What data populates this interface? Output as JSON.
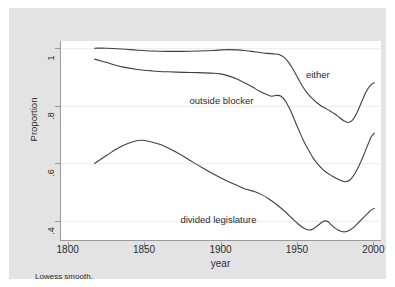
{
  "chart_data": {
    "type": "line",
    "title": "",
    "xlabel": "year",
    "ylabel": "Proportion",
    "note": "Lowess smooth.",
    "xlim": [
      1795,
      2005
    ],
    "ylim": [
      0.33,
      1.025
    ],
    "xticks": [
      "1800",
      "1850",
      "1900",
      "1950",
      "2000"
    ],
    "xtick_values": [
      1800,
      1850,
      1900,
      1950,
      2000
    ],
    "yticks": [
      "1",
      ".8",
      ".6",
      ".4"
    ],
    "ytick_values": [
      1,
      0.8,
      0.6,
      0.4
    ],
    "grid": "horizontal",
    "legend_position": "inline-annotations",
    "line_color": "#404040",
    "grid_color": "#eaeaea",
    "plot_background": "#ffffff",
    "graph_background": "#e3e3e3",
    "series": [
      {
        "name": "either",
        "label": "either",
        "label_x": 1963,
        "label_y": 0.905,
        "x": [
          1817,
          1825,
          1835,
          1845,
          1855,
          1865,
          1875,
          1885,
          1895,
          1900,
          1905,
          1910,
          1915,
          1920,
          1925,
          1930,
          1935,
          1938,
          1941,
          1944,
          1947,
          1950,
          1953,
          1956,
          1959,
          1962,
          1965,
          1968,
          1971,
          1974,
          1977,
          1980,
          1983,
          1986,
          1989,
          1992,
          1995,
          1998,
          2000
        ],
        "y": [
          1.0,
          1.0,
          0.997,
          0.993,
          0.99,
          0.989,
          0.989,
          0.99,
          0.992,
          0.994,
          0.995,
          0.994,
          0.992,
          0.989,
          0.985,
          0.982,
          0.98,
          0.977,
          0.968,
          0.95,
          0.925,
          0.896,
          0.868,
          0.845,
          0.827,
          0.812,
          0.8,
          0.791,
          0.782,
          0.772,
          0.76,
          0.748,
          0.742,
          0.752,
          0.78,
          0.818,
          0.852,
          0.874,
          0.88
        ]
      },
      {
        "name": "outside blocker",
        "label": "outside blocker",
        "label_x": 1900,
        "label_y": 0.812,
        "x": [
          1817,
          1825,
          1835,
          1845,
          1855,
          1865,
          1875,
          1885,
          1895,
          1900,
          1905,
          1910,
          1915,
          1920,
          1925,
          1930,
          1933,
          1936,
          1939,
          1942,
          1945,
          1948,
          1951,
          1954,
          1957,
          1960,
          1963,
          1966,
          1969,
          1972,
          1975,
          1978,
          1981,
          1984,
          1987,
          1990,
          1993,
          1996,
          1998,
          2000
        ],
        "y": [
          0.962,
          0.95,
          0.935,
          0.926,
          0.921,
          0.918,
          0.916,
          0.915,
          0.913,
          0.91,
          0.903,
          0.893,
          0.88,
          0.866,
          0.85,
          0.838,
          0.833,
          0.836,
          0.833,
          0.815,
          0.785,
          0.748,
          0.71,
          0.675,
          0.645,
          0.618,
          0.597,
          0.58,
          0.567,
          0.557,
          0.548,
          0.54,
          0.536,
          0.542,
          0.562,
          0.592,
          0.628,
          0.668,
          0.692,
          0.705
        ]
      },
      {
        "name": "divided legislature",
        "label": "divided legislature",
        "label_x": 1898,
        "label_y": 0.398,
        "x": [
          1817,
          1825,
          1833,
          1841,
          1847,
          1853,
          1860,
          1867,
          1874,
          1881,
          1888,
          1895,
          1902,
          1909,
          1916,
          1921,
          1926,
          1931,
          1936,
          1941,
          1946,
          1950,
          1954,
          1957,
          1960,
          1963,
          1966,
          1968,
          1970,
          1972,
          1975,
          1978,
          1981,
          1984,
          1987,
          1990,
          1993,
          1996,
          1998,
          2000
        ],
        "y": [
          0.6,
          0.628,
          0.655,
          0.673,
          0.68,
          0.676,
          0.665,
          0.648,
          0.628,
          0.605,
          0.583,
          0.562,
          0.543,
          0.526,
          0.51,
          0.503,
          0.492,
          0.476,
          0.457,
          0.435,
          0.41,
          0.39,
          0.374,
          0.368,
          0.372,
          0.384,
          0.396,
          0.4,
          0.396,
          0.385,
          0.372,
          0.364,
          0.362,
          0.368,
          0.38,
          0.396,
          0.412,
          0.428,
          0.438,
          0.443
        ]
      }
    ]
  }
}
